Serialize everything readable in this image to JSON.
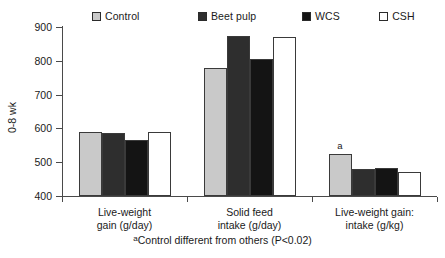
{
  "chart_data": {
    "type": "bar",
    "title": "",
    "xlabel": "",
    "ylabel": "0-8 wk",
    "ylim": [
      400,
      900
    ],
    "yticks": [
      400,
      500,
      600,
      700,
      800,
      900
    ],
    "grid": false,
    "legend_position": "top",
    "categories": [
      "Live-weight gain (g/day)",
      "Solid feed intake (g/day)",
      "Live-weight gain: intake (g/kg)"
    ],
    "category_lines": [
      [
        "Live-weight",
        "gain (g/day)"
      ],
      [
        "Solid feed",
        "intake (g/day)"
      ],
      [
        "Live-weight gain:",
        "intake (g/kg)"
      ]
    ],
    "series": [
      {
        "name": "Control",
        "color": "#c9c9c9",
        "values": [
          588,
          778,
          523
        ]
      },
      {
        "name": "Beet pulp",
        "color": "#2e2e2e",
        "values": [
          586,
          873,
          479
        ]
      },
      {
        "name": "WCS",
        "color": "#141414",
        "values": [
          566,
          806,
          484
        ]
      },
      {
        "name": "CSH",
        "color": "#ffffff",
        "values": [
          589,
          869,
          470
        ]
      }
    ],
    "annotations": [
      {
        "text": "a",
        "group": 2,
        "series": 0
      }
    ],
    "footnote": "Control different from others (P<0.02)",
    "footnote_marker": "a"
  }
}
